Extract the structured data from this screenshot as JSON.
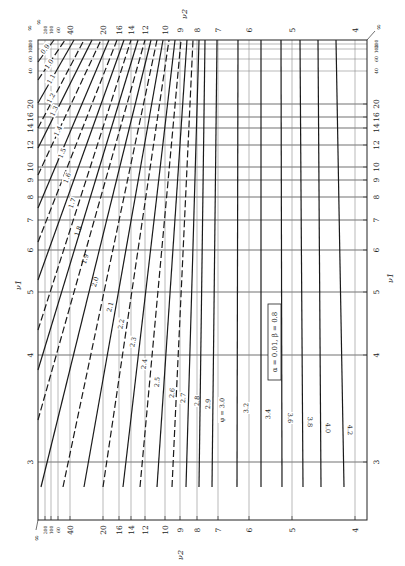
{
  "chart_data": {
    "type": "line",
    "annotation": "α = 0.01, β = 0.8",
    "phi_label_prefix": "φ = ",
    "xlabel": "ν1",
    "ylabel": "ν2",
    "orientation": "rotated-90",
    "nu1_axis": {
      "label": "ν1",
      "ticks": [
        {
          "label": "200",
          "y": 44,
          "small": true
        },
        {
          "label": "100",
          "y": 49,
          "small": true
        },
        {
          "label": "60",
          "y": 59,
          "small": true
        },
        {
          "label": "40",
          "y": 71,
          "small": true
        },
        {
          "label": "20",
          "y": 104
        },
        {
          "label": "16",
          "y": 117
        },
        {
          "label": "14",
          "y": 128
        },
        {
          "label": "12",
          "y": 145
        },
        {
          "label": "10",
          "y": 167
        },
        {
          "label": "9",
          "y": 180
        },
        {
          "label": "8",
          "y": 197
        },
        {
          "label": "7",
          "y": 220
        },
        {
          "label": "6",
          "y": 250
        },
        {
          "label": "5",
          "y": 292
        },
        {
          "label": "4",
          "y": 355
        },
        {
          "label": "3",
          "y": 462
        }
      ],
      "infinity_label": "∞"
    },
    "nu2_axis": {
      "label": "ν2",
      "ticks": [
        {
          "label": "200",
          "x": 45,
          "small": true
        },
        {
          "label": "100",
          "x": 51,
          "small": true
        },
        {
          "label": "60",
          "x": 58,
          "small": true
        },
        {
          "label": "40",
          "x": 70
        },
        {
          "label": "20",
          "x": 103
        },
        {
          "label": "16",
          "x": 119
        },
        {
          "label": "14",
          "x": 131
        },
        {
          "label": "12",
          "x": 145
        },
        {
          "label": "10",
          "x": 165
        },
        {
          "label": "9",
          "x": 180
        },
        {
          "label": "8",
          "x": 197
        },
        {
          "label": "7",
          "x": 218
        },
        {
          "label": "6",
          "x": 249
        },
        {
          "label": "5",
          "x": 292
        },
        {
          "label": "4",
          "x": 355
        }
      ],
      "infinity_label": "∞"
    },
    "frame": {
      "left": 38,
      "top": 40,
      "right": 367,
      "bottom": 520
    },
    "series": [
      {
        "phi": "0.9",
        "dash": false,
        "x1": 38,
        "y1": 62,
        "x2": 54,
        "y2": 40,
        "lx": 45,
        "ly": 49
      },
      {
        "phi": "1.0",
        "dash": true,
        "x1": 38,
        "y1": 80,
        "x2": 65,
        "y2": 40,
        "lx": 49,
        "ly": 64
      },
      {
        "phi": "1.1",
        "dash": false,
        "x1": 38,
        "y1": 103,
        "x2": 74,
        "y2": 40,
        "lx": 51,
        "ly": 79
      },
      {
        "phi": "1.2",
        "dash": true,
        "x1": 38,
        "y1": 128,
        "x2": 84,
        "y2": 40,
        "lx": 51,
        "ly": 98
      },
      {
        "phi": "1.3",
        "dash": false,
        "x1": 38,
        "y1": 148,
        "x2": 92,
        "y2": 40,
        "lx": 54,
        "ly": 111
      },
      {
        "phi": "1.4",
        "dash": true,
        "x1": 38,
        "y1": 175,
        "x2": 101,
        "y2": 40,
        "lx": 58,
        "ly": 131
      },
      {
        "phi": "1.5",
        "dash": false,
        "x1": 38,
        "y1": 208,
        "x2": 109,
        "y2": 40,
        "lx": 62,
        "ly": 153
      },
      {
        "phi": "1.6",
        "dash": true,
        "x1": 38,
        "y1": 242,
        "x2": 117,
        "y2": 40,
        "lx": 67,
        "ly": 178
      },
      {
        "phi": "1.7",
        "dash": false,
        "x1": 38,
        "y1": 280,
        "x2": 124,
        "y2": 40,
        "lx": 72,
        "ly": 203
      },
      {
        "phi": "1.8",
        "dash": true,
        "x1": 38,
        "y1": 330,
        "x2": 131,
        "y2": 40,
        "lx": 78,
        "ly": 231
      },
      {
        "phi": "1.9",
        "dash": false,
        "x1": 38,
        "y1": 370,
        "x2": 138,
        "y2": 40,
        "lx": 85,
        "ly": 259
      },
      {
        "phi": "2.0",
        "dash": true,
        "x1": 38,
        "y1": 420,
        "x2": 145,
        "y2": 40,
        "lx": 95,
        "ly": 282
      },
      {
        "phi": "2.1",
        "dash": false,
        "x1": 41,
        "y1": 487,
        "x2": 151,
        "y2": 40,
        "lx": 110,
        "ly": 307
      },
      {
        "phi": "2.2",
        "dash": true,
        "x1": 63,
        "y1": 487,
        "x2": 157,
        "y2": 40,
        "lx": 121,
        "ly": 324
      },
      {
        "phi": "2.3",
        "dash": false,
        "x1": 84,
        "y1": 487,
        "x2": 163,
        "y2": 40,
        "lx": 133,
        "ly": 342
      },
      {
        "phi": "2.4",
        "dash": true,
        "x1": 103,
        "y1": 487,
        "x2": 169,
        "y2": 40,
        "lx": 144,
        "ly": 364
      },
      {
        "phi": "2.5",
        "dash": false,
        "x1": 123,
        "y1": 487,
        "x2": 175,
        "y2": 40,
        "lx": 157,
        "ly": 382
      },
      {
        "phi": "2.6",
        "dash": true,
        "x1": 140,
        "y1": 487,
        "x2": 181,
        "y2": 40,
        "lx": 172,
        "ly": 393
      },
      {
        "phi": "2.7",
        "dash": false,
        "x1": 157,
        "y1": 487,
        "x2": 187,
        "y2": 40,
        "lx": 183,
        "ly": 398
      },
      {
        "phi": "2.8",
        "dash": true,
        "x1": 172,
        "y1": 487,
        "x2": 193,
        "y2": 40,
        "lx": 197,
        "ly": 401
      },
      {
        "phi": "2.9",
        "dash": false,
        "x1": 186,
        "y1": 487,
        "x2": 199,
        "y2": 40,
        "lx": 208,
        "ly": 404
      },
      {
        "phi": "3.0",
        "dash": false,
        "x1": 199,
        "y1": 487,
        "x2": 205,
        "y2": 40,
        "lx": 222,
        "ly": 410,
        "prefix": true
      },
      {
        "phi": "3.2",
        "dash": false,
        "x1": 212,
        "y1": 487,
        "x2": 217,
        "y2": 40,
        "lx": 246,
        "ly": 408
      },
      {
        "phi": "3.4",
        "dash": false,
        "x1": 237,
        "y1": 487,
        "x2": 238,
        "y2": 40,
        "lx": 268,
        "ly": 414
      },
      {
        "phi": "3.6",
        "dash": false,
        "x1": 261,
        "y1": 487,
        "x2": 261,
        "y2": 40,
        "lx": 290,
        "ly": 418
      },
      {
        "phi": "3.8",
        "dash": false,
        "x1": 282,
        "y1": 487,
        "x2": 281,
        "y2": 40,
        "lx": 310,
        "ly": 422
      },
      {
        "phi": "4.0",
        "dash": false,
        "x1": 303,
        "y1": 487,
        "x2": 300,
        "y2": 40,
        "lx": 328,
        "ly": 428
      },
      {
        "phi": "4.2",
        "dash": false,
        "x1": 321,
        "y1": 487,
        "x2": 318,
        "y2": 40,
        "lx": 350,
        "ly": 430
      },
      {
        "phi": "",
        "dash": false,
        "x1": 344,
        "y1": 487,
        "x2": 336,
        "y2": 40,
        "lx": 0,
        "ly": 0
      }
    ]
  }
}
